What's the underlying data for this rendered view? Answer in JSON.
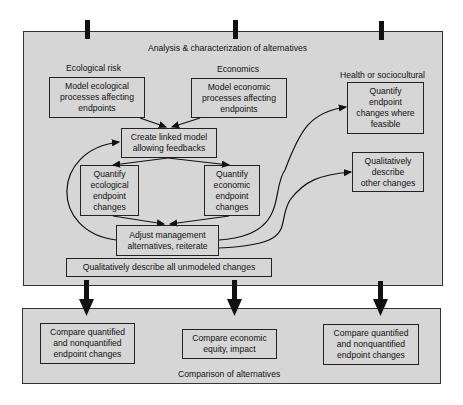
{
  "analysis_frame": {
    "title": "Analysis & characterization of alternatives",
    "columns": {
      "ecological": {
        "label": "Ecological risk",
        "model_box": "Model ecological\nprocesses affecting\nendpoints",
        "quantify_box": "Quantify\necological\nendpoint\nchanges"
      },
      "economics": {
        "label": "Economics",
        "model_box": "Model economic\nprocesses affecting\nendpoints",
        "quantify_box": "Quantify\neconomic\nendpoint\nchanges"
      },
      "health": {
        "label": "Health or sociocultural",
        "quantify_box": "Quantify\nendpoint\nchanges where\nfeasible",
        "qualitative_box": "Qualitatively\ndescribe\nother changes"
      }
    },
    "linked_model_box": "Create linked model\nallowing feedbacks",
    "adjust_box": "Adjust management\nalternatives, reiterate",
    "unmodeled_box": "Qualitatively describe all unmodeled changes"
  },
  "comparison_frame": {
    "title": "Comparison of alternatives",
    "boxes": [
      "Compare quantified\nand nonquantified\nendpoint changes",
      "Compare economic\nequity, impact",
      "Compare quantified\nand nonquantified\nendpoint changes"
    ]
  },
  "colors": {
    "panel_fill": "#d6d6d6",
    "stroke": "#222222",
    "background": "#ffffff"
  }
}
